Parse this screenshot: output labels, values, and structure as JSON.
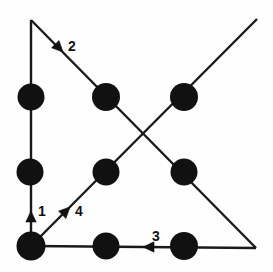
{
  "diagram": {
    "type": "node-link-diagram",
    "canvas": {
      "width": 273,
      "height": 272
    },
    "colors": {
      "background": "#fefefe",
      "stroke": "#1a1a1a",
      "node_fill": "#111111",
      "label_fill": "#111111"
    },
    "nodes": [
      {
        "id": "n-left-top",
        "name": "node-left-top",
        "cx": 31,
        "cy": 97,
        "r": 13.5
      },
      {
        "id": "n-left-middle",
        "name": "node-left-middle",
        "cx": 30,
        "cy": 172,
        "r": 13.5
      },
      {
        "id": "n-left-bottom",
        "name": "node-left-bottom",
        "cx": 31,
        "cy": 246,
        "r": 14.5
      },
      {
        "id": "n-center-top",
        "name": "node-center-top",
        "cx": 106,
        "cy": 97,
        "r": 14
      },
      {
        "id": "n-center-middle",
        "name": "node-center-middle",
        "cx": 106,
        "cy": 172,
        "r": 13.5
      },
      {
        "id": "n-center-bottom",
        "name": "node-center-bottom",
        "cx": 106,
        "cy": 246,
        "r": 13.5
      },
      {
        "id": "n-right-top",
        "name": "node-right-top",
        "cx": 184,
        "cy": 97,
        "r": 14
      },
      {
        "id": "n-right-middle",
        "name": "node-right-middle",
        "cx": 184,
        "cy": 172,
        "r": 13.5
      },
      {
        "id": "n-right-bottom",
        "name": "node-right-bottom",
        "cx": 184,
        "cy": 246,
        "r": 14
      }
    ],
    "edges": [
      {
        "id": "e1",
        "name": "edge-left-vertical",
        "label": "1",
        "direction": "up",
        "x1": 31,
        "y1": 246,
        "x2": 31,
        "y2": 20,
        "arrow": {
          "x": 31,
          "y": 211,
          "angle": -90
        },
        "label_pos": {
          "x": 38,
          "y": 216
        }
      },
      {
        "id": "e2",
        "name": "edge-top-left-to-bottom-right-diagonal",
        "label": "2",
        "direction": "down-right",
        "x1": 31,
        "y1": 20,
        "x2": 256,
        "y2": 248,
        "arrow": {
          "x": 63,
          "y": 52,
          "angle": 45.4
        },
        "label_pos": {
          "x": 68,
          "y": 51
        }
      },
      {
        "id": "e3",
        "name": "edge-bottom-horizontal",
        "label": "3",
        "direction": "left",
        "x1": 256,
        "y1": 248,
        "x2": 31,
        "y2": 246,
        "arrow": {
          "x": 143,
          "y": 247,
          "angle": 180
        },
        "label_pos": {
          "x": 152,
          "y": 241
        }
      },
      {
        "id": "e4",
        "name": "edge-bottom-left-to-top-right-diagonal",
        "label": "4",
        "direction": "up-right",
        "x1": 31,
        "y1": 246,
        "x2": 257,
        "y2": 19,
        "arrow": {
          "x": 70,
          "y": 207,
          "angle": -45.1
        },
        "label_pos": {
          "x": 75,
          "y": 216
        }
      }
    ],
    "crossing_point": {
      "x": 145,
      "y": 134
    }
  }
}
